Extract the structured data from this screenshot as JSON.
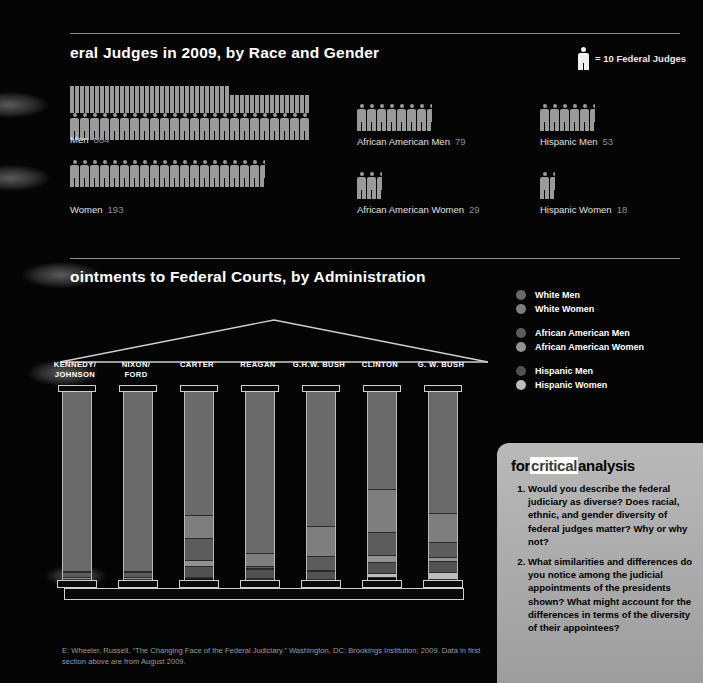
{
  "section1": {
    "title": "eral Judges in 2009, by Race and Gender",
    "key": {
      "icon": "person-icon",
      "label": "= 10 Federal Judges"
    },
    "groups": [
      {
        "name": "Men",
        "label": "Men",
        "value": "884",
        "icons": 88.4
      },
      {
        "name": "African American Men",
        "label": "African American Men",
        "value": "79",
        "icons": 7.9
      },
      {
        "name": "Hispanic Men",
        "label": "Hispanic Men",
        "value": "53",
        "icons": 5.3
      },
      {
        "name": "Women",
        "label": "Women",
        "value": "193",
        "icons": 19.3
      },
      {
        "name": "African American Women",
        "label": "African American Women",
        "value": "29",
        "icons": 2.9
      },
      {
        "name": "Hispanic Women",
        "label": "Hispanic Women",
        "value": "18",
        "icons": 1.8
      }
    ]
  },
  "section2": {
    "title": "ointments to Federal Courts, by Administration",
    "legend": [
      {
        "label": "White Men",
        "color": "#6a6a6a"
      },
      {
        "label": "White Women",
        "color": "#7e7e7e"
      },
      {
        "label": "African American Men",
        "color": "#5c5c5c"
      },
      {
        "label": "African American Women",
        "color": "#929292"
      },
      {
        "label": "Hispanic Men",
        "color": "#525252"
      },
      {
        "label": "Hispanic Women",
        "color": "#bdbdbd"
      }
    ]
  },
  "chart_data": {
    "type": "bar",
    "title": "ointments to Federal Courts, by Administration",
    "stacked": true,
    "unit": "%",
    "xlabel": "",
    "ylabel": "Share of appointments",
    "ylim": [
      0,
      100
    ],
    "grid": false,
    "legend_position": "right",
    "categories": [
      "KENNEDY/\nJOHNSON",
      "NIXON/\nFORD",
      "CARTER",
      "REAGAN",
      "G.H.W. BUSH",
      "CLINTON",
      "G. W. BUSH"
    ],
    "series": [
      {
        "name": "White Men",
        "color": "#6a6a6a",
        "values": [
          96,
          96,
          66,
          86,
          72,
          52,
          67
        ],
        "labels": [
          "96%",
          "96%",
          "66%",
          "86%",
          "72%",
          "52%",
          "67%"
        ]
      },
      {
        "name": "White Women",
        "color": "#7e7e7e",
        "values": [
          0.5,
          0.5,
          12,
          7,
          16,
          23,
          16
        ],
        "labels": [
          "<1%",
          "<1%",
          "12%",
          "7%",
          "16%",
          "23%",
          "16%"
        ]
      },
      {
        "name": "African American Men",
        "color": "#5c5c5c",
        "values": [
          3,
          3,
          12,
          1,
          7,
          12,
          8
        ],
        "labels": [
          "3%",
          "3%",
          "12%",
          "1%",
          "7%",
          "12%",
          "8%"
        ]
      },
      {
        "name": "African American Women",
        "color": "#929292",
        "values": [
          1,
          1,
          3,
          0.5,
          1,
          4,
          2
        ],
        "labels": [
          "1%",
          "1%",
          "3%",
          "<1%",
          "1%",
          "4%",
          "2%"
        ]
      },
      {
        "name": "Hispanic Men",
        "color": "#525252",
        "values": [
          0,
          0,
          6,
          5,
          4,
          6,
          6
        ],
        "labels": [
          "",
          "",
          "6%",
          "5%",
          "4%",
          "6%",
          "6%"
        ]
      },
      {
        "name": "Hispanic Women",
        "color": "#bdbdbd",
        "values": [
          0,
          0,
          0.5,
          0.5,
          0,
          2,
          4
        ],
        "labels": [
          "",
          "",
          "<1%",
          "<1%",
          "",
          "2%",
          "4%"
        ]
      }
    ]
  },
  "critical": {
    "head_1": "for",
    "head_2": "critical",
    "head_3": "analysis",
    "items": [
      "Would you describe the federal judiciary as diverse? Does racial, ethnic, and gender diversity of federal judges matter? Why or why not?",
      "What similarities and differences do you notice among the judicial appointments of the presidents shown? What might account for the differences in terms of the diversity of their appointees?"
    ]
  },
  "source": {
    "text": "E: Wheeler, Russell, “The Changing Face of the Federal Judiciary.” Washington, DC: Brookings Institution; 2009. Data in first section above are from August 2009."
  }
}
